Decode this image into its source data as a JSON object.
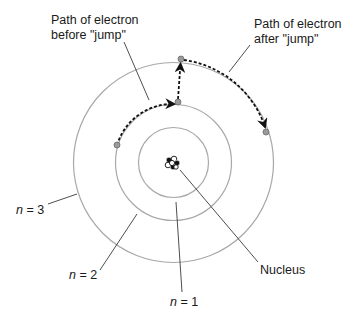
{
  "labels": {
    "path_before_line1": "Path of electron",
    "path_before_line2": "before \"jump\"",
    "path_after_line1": "Path of electron",
    "path_after_line2": "after \"jump\"",
    "nucleus": "Nucleus",
    "n1_var": "n",
    "n1_rest": " = 1",
    "n2_var": "n",
    "n2_rest": " = 2",
    "n3_var": "n",
    "n3_rest": " = 3"
  },
  "orbits": [
    {
      "n": 1,
      "radius": 35
    },
    {
      "n": 2,
      "radius": 58
    },
    {
      "n": 3,
      "radius": 100
    }
  ],
  "center": {
    "x": 173.5,
    "y": 162.5
  },
  "electrons": [
    {
      "name": "start-n2",
      "x": 117,
      "y": 145
    },
    {
      "name": "jump-point-n2",
      "x": 178,
      "y": 102
    },
    {
      "name": "landing-point-n3",
      "x": 181,
      "y": 59
    },
    {
      "name": "end-n3",
      "x": 266,
      "y": 132
    }
  ],
  "colors": {
    "orbit": "#a8a8a8",
    "leader": "#3a3a3a",
    "path": "#111111",
    "electron_fill": "#9a9a9a",
    "electron_stroke": "#6a6a6a",
    "text": "#1a1a1a"
  }
}
